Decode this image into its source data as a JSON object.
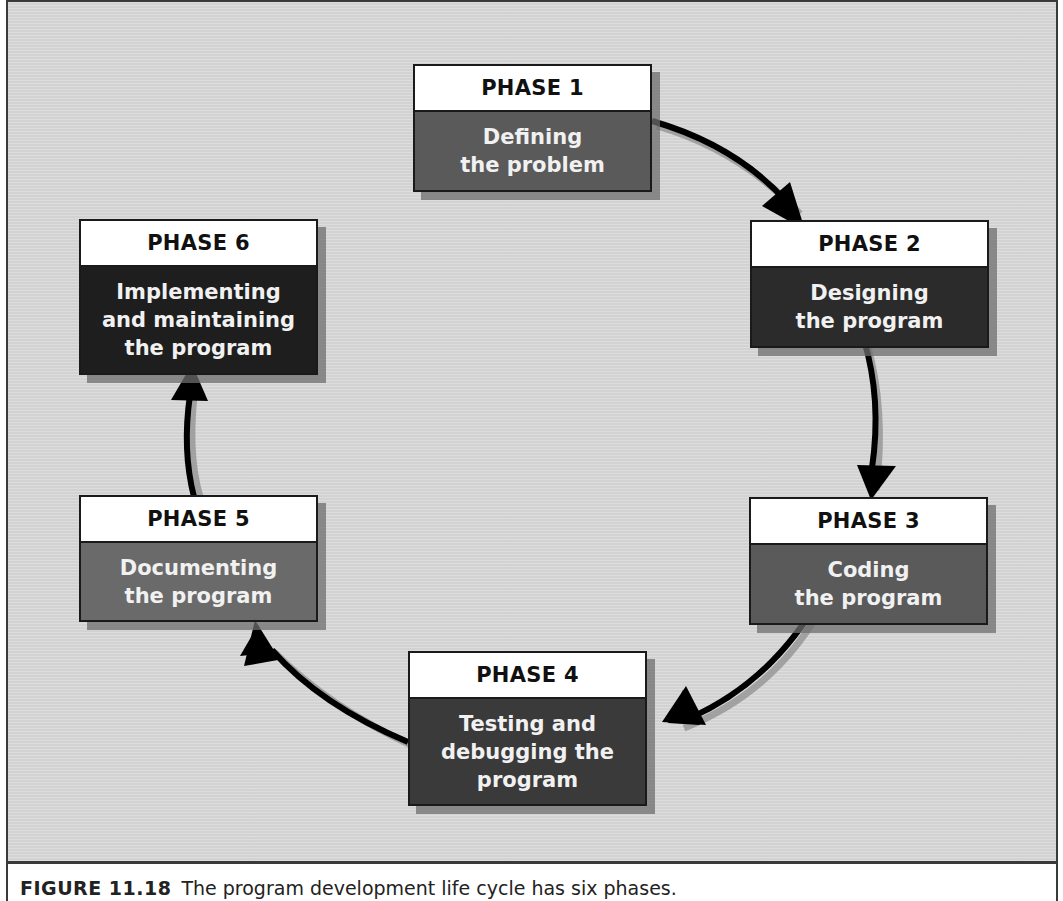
{
  "diagram": {
    "type": "cycle",
    "phases": [
      {
        "label": "PHASE 1",
        "lines": [
          "Defining",
          "the problem"
        ],
        "fill": "#5a5a5a"
      },
      {
        "label": "PHASE 2",
        "lines": [
          "Designing",
          "the program"
        ],
        "fill": "#2b2b2b"
      },
      {
        "label": "PHASE 3",
        "lines": [
          "Coding",
          "the program"
        ],
        "fill": "#5a5a5a"
      },
      {
        "label": "PHASE 4",
        "lines": [
          "Testing and",
          "debugging the",
          "program"
        ],
        "fill": "#3a3a3a"
      },
      {
        "label": "PHASE 5",
        "lines": [
          "Documenting",
          "the program"
        ],
        "fill": "#6a6a6a"
      },
      {
        "label": "PHASE 6",
        "lines": [
          "Implementing",
          "and maintaining",
          "the program"
        ],
        "fill": "#1e1e1e"
      }
    ],
    "arrows": [
      {
        "from": "PHASE 1",
        "to": "PHASE 2"
      },
      {
        "from": "PHASE 2",
        "to": "PHASE 3"
      },
      {
        "from": "PHASE 3",
        "to": "PHASE 4"
      },
      {
        "from": "PHASE 4",
        "to": "PHASE 5"
      },
      {
        "from": "PHASE 5",
        "to": "PHASE 6"
      }
    ]
  },
  "caption": {
    "figure_label": "FIGURE 11.18",
    "text": "The program development life cycle has six phases."
  }
}
